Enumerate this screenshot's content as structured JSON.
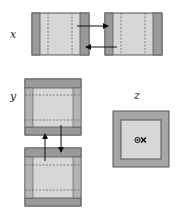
{
  "labels": {
    "x": "x",
    "y": "y",
    "z": "z"
  },
  "colors": {
    "frame": "#9a9a9a",
    "inner": "#d7d7d7",
    "outline": "#555555",
    "dashed": "#666666",
    "arrow": "#111111"
  },
  "panels": {
    "x": {
      "description": "Two side-by-side frames connected by opposing horizontal arrows",
      "arrows": [
        "right",
        "left"
      ]
    },
    "y": {
      "description": "Two stacked frames connected by opposing vertical arrows",
      "arrows": [
        "up",
        "down"
      ]
    },
    "z": {
      "description": "Single frame viewed along z with out-of-plane / into-plane symbol",
      "symbol": "dot-and-cross"
    }
  }
}
